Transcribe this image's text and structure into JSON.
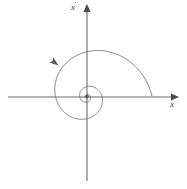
{
  "figure": {
    "kind": "phase-plane-diagram",
    "background_color": "#ffffff",
    "stroke_color": "#6b6b6b",
    "axis_color": "#6b6b6b",
    "label_color": "#3a3a3a",
    "width": 187,
    "height": 189
  },
  "axes": {
    "x_axis": {
      "label": "x",
      "label_glyph": "x",
      "name": "horizontal-axis",
      "start_px": [
        8,
        97
      ],
      "end_px": [
        174,
        97
      ],
      "arrow_at": "right"
    },
    "y_axis": {
      "label": "ẋ",
      "label_base": "x",
      "label_accent": "dot-above",
      "name": "vertical-axis",
      "start_px": [
        87,
        181
      ],
      "end_px": [
        87,
        8
      ],
      "arrow_at": "top"
    },
    "origin_px": [
      87,
      97
    ]
  },
  "chart_data": {
    "type": "line",
    "title": "",
    "xlabel": "x",
    "ylabel": "ẋ",
    "grid": false,
    "legend": null,
    "series": [
      {
        "name": "spiral-trajectory",
        "description": "logarithmic spiral converging counterclockwise to the origin (stable focus)",
        "direction": "counterclockwise-inward",
        "start_point_px": [
          152,
          96
        ],
        "end_point_px": [
          87,
          97
        ],
        "turns": 3.2,
        "extents_px": {
          "leftmost_x": 33,
          "rightmost_x": 152,
          "topmost_y": 56,
          "bottommost_y": 147
        }
      }
    ],
    "annotations": [
      {
        "name": "direction-arrowhead",
        "glyph": "arrowhead",
        "position_px": [
          58,
          65
        ],
        "angle_deg": 215,
        "meaning": "trajectory direction of travel"
      },
      {
        "name": "equilibrium-point",
        "glyph": "dot",
        "position_px": [
          87,
          97
        ],
        "meaning": "origin / stable equilibrium"
      }
    ]
  }
}
